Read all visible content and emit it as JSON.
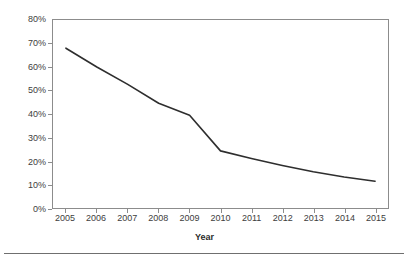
{
  "chart_data": {
    "type": "line",
    "title": "",
    "subtitle": "",
    "xlabel": "Year",
    "ylabel": "",
    "categories": [
      "2005",
      "2006",
      "2007",
      "2008",
      "2009",
      "2010",
      "2011",
      "2012",
      "2013",
      "2014",
      "2015"
    ],
    "x": [
      2005,
      2006,
      2007,
      2008,
      2009,
      2010,
      2011,
      2012,
      2013,
      2014,
      2015
    ],
    "values": [
      68,
      60,
      52.6,
      44.6,
      39.5,
      24.3,
      21.1,
      18.1,
      15.4,
      13.2,
      11.4
    ],
    "series": [
      {
        "name": "",
        "values": [
          68,
          60,
          52.6,
          44.6,
          39.5,
          24.3,
          21.1,
          18.1,
          15.4,
          13.2,
          11.4
        ]
      }
    ],
    "ylim": [
      0,
      80
    ],
    "ytick_step": 10,
    "ytick_labels": [
      "0%",
      "10%",
      "20%",
      "30%",
      "40%",
      "50%",
      "60%",
      "70%",
      "80%"
    ],
    "ytick_values": [
      0,
      10,
      20,
      30,
      40,
      50,
      60,
      70,
      80
    ],
    "xtick_labels": [
      "2005",
      "2006",
      "2007",
      "2008",
      "2009",
      "2010",
      "2011",
      "2012",
      "2013",
      "2014",
      "2015"
    ],
    "grid": false,
    "legend": "none",
    "line_color": "#2e2e2e",
    "axis_color": "#8c8c8c",
    "markers": false,
    "annotations": []
  },
  "axes": {
    "x_title": "Year"
  },
  "colors": {
    "line": "#2e2e2e",
    "axis": "#8c8c8c",
    "text": "#3d3d3d",
    "background": "#ffffff",
    "rule": "#6f6f6f"
  }
}
